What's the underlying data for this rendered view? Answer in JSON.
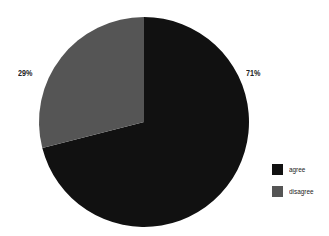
{
  "chart_data": {
    "type": "pie",
    "title": "",
    "categories": [
      "agree",
      "disagree"
    ],
    "values": [
      71,
      29
    ],
    "labels": [
      "71%",
      "29%"
    ],
    "colors": [
      "#111111",
      "#555555"
    ],
    "start_angle_deg": 0,
    "direction": "clockwise",
    "legend_position": "right"
  },
  "legend": {
    "items": [
      {
        "label": "agree",
        "color": "#111111"
      },
      {
        "label": "disagree",
        "color": "#555555"
      }
    ]
  }
}
